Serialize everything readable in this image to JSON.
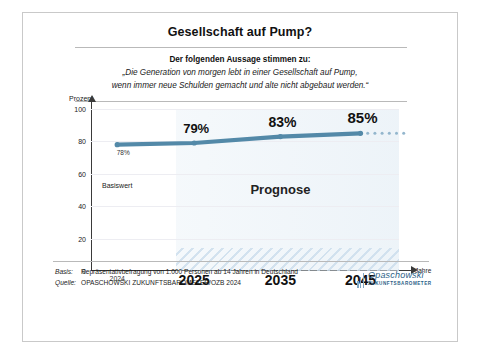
{
  "header": {
    "title": "Gesellschaft auf Pump?",
    "subtitle": "Der folgenden Aussage stimmen zu:",
    "quote_line1": "„Die Generation von morgen lebt in einer Gesellschaft auf Pump,",
    "quote_line2": "wenn immer neue Schulden gemacht und alte nicht abgebaut werden.“"
  },
  "footer": {
    "basis_label": "Basis:",
    "basis_text": "Repräsentativbefragung von 1.000 Personen ab 14 Jahren in Deutschland",
    "source_label": "Quelle:",
    "source_text": "OPASCHOWSKI ZUKUNFTSBAROMETER/OZB 2024",
    "logo_name": "Opaschowski",
    "logo_sub": "ZUKUNFTSBAROMETER",
    "logo_color": "#2c5f87"
  },
  "chart_data": {
    "type": "line",
    "title": "Gesellschaft auf Pump?",
    "xlabel": "Jahre",
    "ylabel": "Prozent",
    "categories": [
      "2024",
      "2025",
      "2035",
      "2045"
    ],
    "values": [
      78,
      79,
      83,
      85
    ],
    "point_labels": [
      "78%",
      "79%",
      "83%",
      "85%"
    ],
    "ylim": [
      0,
      100
    ],
    "yticks": [
      0,
      20,
      40,
      60,
      80,
      100
    ],
    "ytick_labels": [
      "0",
      "20",
      "40",
      "60",
      "80",
      "100"
    ],
    "grid": true,
    "legend": "none",
    "series_color": "#5389a8",
    "annotations": [
      {
        "text": "Basiswert",
        "x": "2024",
        "y": 50
      },
      {
        "text": "Prognose",
        "x": "2035",
        "y": 50
      }
    ],
    "forecast_from": "2025",
    "trailing_dots": 6
  }
}
